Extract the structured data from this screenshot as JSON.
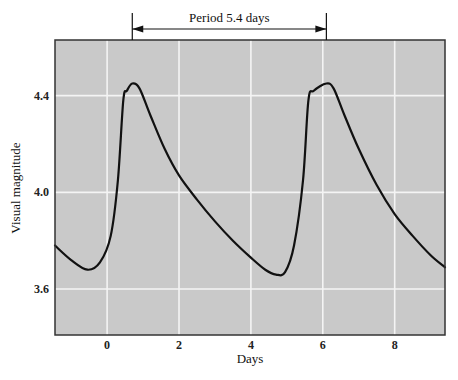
{
  "chart_data": {
    "type": "line",
    "title": "",
    "annotation": "Period  5.4 days",
    "annotation_span": [
      0.7,
      6.1
    ],
    "xlabel": "Days",
    "ylabel": "Visual magnitude",
    "xlim": [
      -1.45,
      9.4
    ],
    "ylim": [
      3.41,
      4.63
    ],
    "x_ticks": [
      0,
      2,
      4,
      6,
      8
    ],
    "x_tick_labels": [
      "0",
      "2",
      "4",
      "6",
      "8"
    ],
    "y_ticks": [
      3.6,
      4.0,
      4.4
    ],
    "y_tick_labels": [
      "3.6",
      "4.0",
      "4.4"
    ],
    "grid": true,
    "legend": null,
    "series": [
      {
        "name": "Light curve",
        "x": [
          -1.45,
          -1.0,
          -0.55,
          -0.2,
          0.1,
          0.3,
          0.45,
          0.55,
          0.7,
          0.9,
          1.2,
          1.6,
          2.0,
          2.5,
          3.0,
          3.5,
          4.0,
          4.4,
          4.7,
          4.95,
          5.2,
          5.45,
          5.6,
          5.75,
          6.1,
          6.3,
          6.6,
          7.0,
          7.5,
          8.0,
          8.5,
          9.0,
          9.4
        ],
        "y": [
          3.78,
          3.72,
          3.68,
          3.71,
          3.82,
          4.05,
          4.38,
          4.42,
          4.45,
          4.43,
          4.32,
          4.18,
          4.07,
          3.97,
          3.88,
          3.8,
          3.73,
          3.68,
          3.66,
          3.67,
          3.78,
          4.05,
          4.38,
          4.42,
          4.45,
          4.43,
          4.32,
          4.18,
          4.03,
          3.91,
          3.82,
          3.74,
          3.69
        ]
      }
    ]
  },
  "colors": {
    "plot_background": "#c9c9c9",
    "gridlines": "#f4f4f4",
    "curve": "#111111",
    "frame": "#333333"
  }
}
